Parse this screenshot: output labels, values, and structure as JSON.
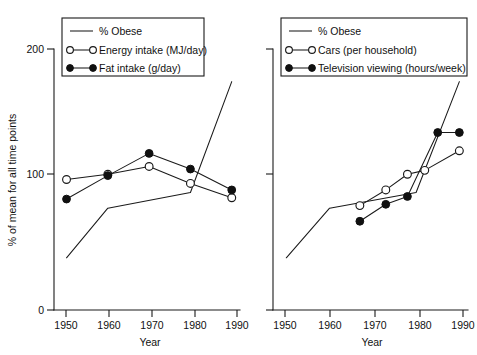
{
  "figure": {
    "background_color": "#ffffff",
    "ink_color": "#1a1a1a",
    "panel_count": 2
  },
  "axes": {
    "y_label": "% of mean for all time points",
    "y_ticks": [
      "0",
      "100",
      "200"
    ],
    "x_label": "Year",
    "x_ticks": [
      "1950",
      "1960",
      "1970",
      "1980",
      "1990"
    ]
  },
  "legends": {
    "left": {
      "entries": [
        {
          "label": "% Obese",
          "marker": "none"
        },
        {
          "label": "Energy intake (MJ/day)",
          "marker": "open-circle"
        },
        {
          "label": "Fat intake (g/day)",
          "marker": "filled-circle"
        }
      ]
    },
    "right": {
      "entries": [
        {
          "label": "% Obese",
          "marker": "none"
        },
        {
          "label": "Cars (per household)",
          "marker": "open-circle"
        },
        {
          "label": "Television viewing (hours/week)",
          "marker": "filled-circle"
        }
      ]
    }
  },
  "chart_data": [
    {
      "type": "line",
      "panel": "left",
      "title": "",
      "xlabel": "Year",
      "ylabel": "% of mean for all time points",
      "xlim": [
        1946,
        1992
      ],
      "ylim": [
        0,
        210
      ],
      "yticks": [
        0,
        100,
        200
      ],
      "xticks": [
        1950,
        1960,
        1970,
        1980,
        1990
      ],
      "grid": false,
      "legend_position": "top-left",
      "series": [
        {
          "name": "% Obese",
          "marker": "none",
          "x": [
            1950,
            1960,
            1980,
            1990
          ],
          "values": [
            40,
            78,
            90,
            175
          ]
        },
        {
          "name": "Energy intake (MJ/day)",
          "marker": "open-circle",
          "x": [
            1950,
            1960,
            1970,
            1980,
            1990
          ],
          "values": [
            100,
            104,
            110,
            97,
            86
          ]
        },
        {
          "name": "Fat intake (g/day)",
          "marker": "filled-circle",
          "x": [
            1950,
            1960,
            1970,
            1980,
            1990
          ],
          "values": [
            85,
            103,
            120,
            108,
            92
          ]
        }
      ]
    },
    {
      "type": "line",
      "panel": "right",
      "title": "",
      "xlabel": "Year",
      "ylabel": "% of mean for all time points",
      "xlim": [
        1946,
        1992
      ],
      "ylim": [
        0,
        210
      ],
      "yticks": [
        0,
        100,
        200
      ],
      "xticks": [
        1950,
        1960,
        1970,
        1980,
        1990
      ],
      "grid": false,
      "legend_position": "top-left",
      "series": [
        {
          "name": "% Obese",
          "marker": "none",
          "x": [
            1950,
            1960,
            1980,
            1990
          ],
          "values": [
            40,
            78,
            90,
            175
          ]
        },
        {
          "name": "Cars (per household)",
          "marker": "open-circle",
          "x": [
            1967,
            1973,
            1978,
            1982,
            1990
          ],
          "values": [
            80,
            92,
            104,
            107,
            122
          ]
        },
        {
          "name": "Television viewing (hours/week)",
          "marker": "filled-circle",
          "x": [
            1967,
            1973,
            1978,
            1985,
            1990
          ],
          "values": [
            68,
            81,
            87,
            136,
            136
          ]
        }
      ]
    }
  ]
}
